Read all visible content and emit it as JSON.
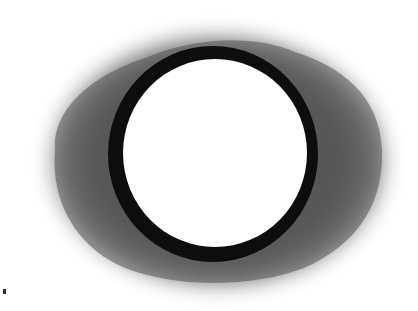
{
  "image": {
    "subject": "charcoal-drawn dark ring with soft grey halo",
    "background_color": "#ffffff",
    "halo": {
      "color": "#5a5a5a",
      "edge_color": "#bdbdbd",
      "center": [
        212,
        160
      ],
      "rx": 186,
      "ry": 140
    },
    "ring": {
      "color": "#0d0d0d",
      "center": [
        213,
        154
      ],
      "outer_rx": 105,
      "outer_ry": 108,
      "inner_rx": 92,
      "inner_ry": 94
    },
    "inner_fill": "#ffffff",
    "stray_mark": {
      "color": "#333333",
      "position": [
        4,
        291
      ]
    }
  }
}
